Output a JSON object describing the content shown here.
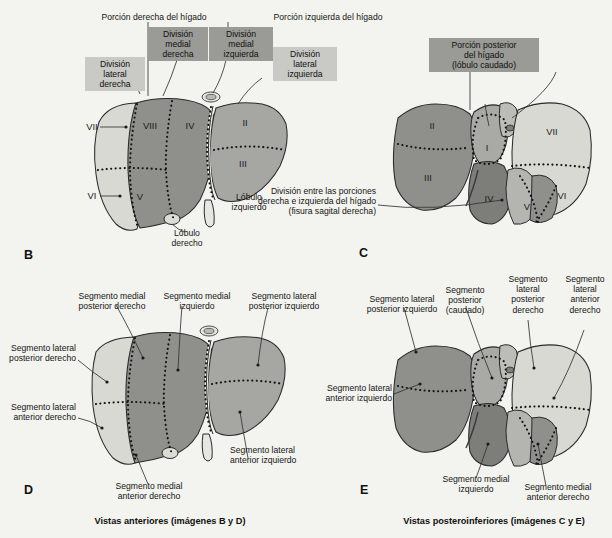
{
  "figure": {
    "title_captions": {
      "anterior": "Vistas anteriores (imágenes B y D)",
      "posteroinferior": "Vistas posteroinferiores (imágenes C y E)"
    }
  },
  "panels": {
    "B": {
      "letter": "B",
      "top_labels": {
        "right_portion": "Porción derecha del hígado",
        "left_portion": "Porción izquierda del hígado"
      },
      "boxes": [
        {
          "id": "lateral_derecha",
          "text": "División\nlateral\nderecha",
          "shade": "light"
        },
        {
          "id": "medial_derecha",
          "text": "División\nmedial\nderecha",
          "shade": "dark"
        },
        {
          "id": "medial_izquierda",
          "text": "División\nmedial\nizquierda",
          "shade": "dark"
        },
        {
          "id": "lateral_izquierda",
          "text": "División\nlateral\nizquierda",
          "shade": "light"
        }
      ],
      "segments": [
        "VII",
        "VIII",
        "IV",
        "II",
        "VI",
        "V",
        "III"
      ],
      "lobe_labels": {
        "right": "Lóbulo\nderecho",
        "left": "Lóbulo\nizquierdo"
      }
    },
    "C": {
      "letter": "C",
      "box": {
        "text": "Porción posterior\ndel hígado\n(lóbulo caudado)",
        "shade": "dark"
      },
      "segments": [
        "II",
        "I",
        "VII",
        "III",
        "IV",
        "V",
        "VI"
      ],
      "note": "División entre las porciones\nderecha e izquierda del hígado\n(fisura sagital derecha)"
    },
    "D": {
      "letter": "D",
      "labels": {
        "medial_posterior_derecho": "Segmento medial\nposterior derecho",
        "medial_izquierdo": "Segmento medial\nizquierdo",
        "lateral_posterior_izquierdo": "Segmento lateral\nposterior izquierdo",
        "lateral_posterior_derecho": "Segmento lateral\nposterior derecho",
        "lateral_anterior_derecho": "Segmento lateral\nanterior derecho",
        "medial_anterior_derecho": "Segmento medial\nanterior derecho",
        "lateral_anterior_izquierdo": "Segmento lateral\nanterior izquierdo"
      }
    },
    "E": {
      "letter": "E",
      "labels": {
        "lateral_posterior_izquierdo": "Segmento lateral\nposterior izquierdo",
        "posterior_caudado": "Segmento\nposterior\n(caudado)",
        "lateral_posterior_derecho": "Segmento\nlateral\nposterior\nderecho",
        "lateral_anterior_derecho": "Segmento\nlateral\nanterior\nderecho",
        "lateral_anterior_izquierdo": "Segmento lateral\nanterior izquierdo",
        "medial_izquierdo": "Segmento medial\nizquierdo",
        "medial_anterior_derecho": "Segmento medial\nanterior derecho"
      }
    }
  },
  "colors": {
    "background": "#f3f3ef",
    "liver_light": "#d9d9d4",
    "liver_mid": "#8f8f8b",
    "liver_dark": "#6f6f6b",
    "box_light": "#c9c9c5",
    "box_dark": "#9a9a96",
    "outline": "#2a2a2a"
  }
}
